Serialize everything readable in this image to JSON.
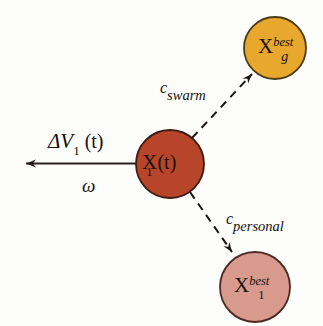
{
  "figure": {
    "background_color": "#fdfdfc",
    "stroke_color": "#1a1414",
    "text_color": "#141010"
  },
  "nodes": [
    {
      "id": "global-best",
      "name": "global-best-particle",
      "fill": "#e8a82e",
      "stroke": "#4a3a1a",
      "cx": 275,
      "cy": 48,
      "r": 31,
      "label_base": "X",
      "label_sup": "best",
      "label_sub": "g"
    },
    {
      "id": "current-position",
      "name": "current-particle",
      "fill": "#b8442a",
      "stroke": "#3a1a12",
      "cx": 170,
      "cy": 164,
      "r": 34,
      "label_base": "X",
      "label_sub": "1",
      "label_paren": "(t)"
    },
    {
      "id": "personal-best",
      "name": "personal-best-particle",
      "fill": "#d89a8c",
      "stroke": "#4a2a22",
      "cx": 255,
      "cy": 287,
      "r": 35,
      "label_base": "X",
      "label_sup": "best",
      "label_sub": "1"
    }
  ],
  "edges": [
    {
      "id": "swarm-edge",
      "name": "swarm-attraction-arrow",
      "style": "dashed",
      "label_c": "c",
      "label_sub": "swarm",
      "label_x": 160,
      "label_y": 80
    },
    {
      "id": "personal-edge",
      "name": "personal-attraction-arrow",
      "style": "dashed",
      "label_c": "c",
      "label_sub": "personal",
      "label_x": 226,
      "label_y": 211
    }
  ],
  "velocity": {
    "name": "velocity-vector",
    "style": "solid",
    "delta": "Δ",
    "v": "V",
    "v_sub": "1",
    "t_part": "(t)",
    "omega": "ω",
    "label_x": 48,
    "label_y": 131,
    "omega_x": 82,
    "omega_y": 176
  }
}
